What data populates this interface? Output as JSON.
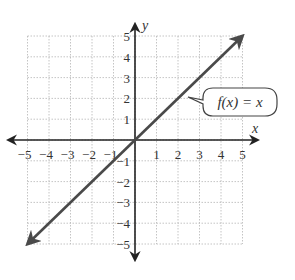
{
  "chart_data": {
    "type": "line",
    "title": "",
    "xlabel": "x",
    "ylabel": "y",
    "xlim": [
      -5,
      5
    ],
    "ylim": [
      -5,
      5
    ],
    "grid": true,
    "x_ticks": [
      -5,
      -4,
      -3,
      -2,
      -1,
      1,
      2,
      3,
      4,
      5
    ],
    "y_ticks": [
      5,
      4,
      3,
      2,
      1,
      -1,
      -2,
      -3,
      -4,
      -5
    ],
    "x_tick_labels": [
      "−5",
      "−4",
      "−3",
      "−2",
      "−1",
      "1",
      "2",
      "3",
      "4",
      "5"
    ],
    "y_tick_labels": [
      "5",
      "4",
      "3",
      "2",
      "1",
      "−1",
      "−2",
      "−3",
      "−4",
      "−5"
    ],
    "series": [
      {
        "name": "f(x) = x",
        "x": [
          -5,
          5
        ],
        "y": [
          -5,
          5
        ],
        "arrows": "both"
      }
    ],
    "annotations": [
      {
        "text": "f(x) = x",
        "points_to": [
          1.3,
          1.3
        ]
      }
    ]
  },
  "labels": {
    "x_axis": "x",
    "y_axis": "y",
    "callout": "f(x) = x"
  },
  "colors": {
    "axis": "#222222",
    "line": "#4a4a4a",
    "grid": "#b5b5b5"
  }
}
